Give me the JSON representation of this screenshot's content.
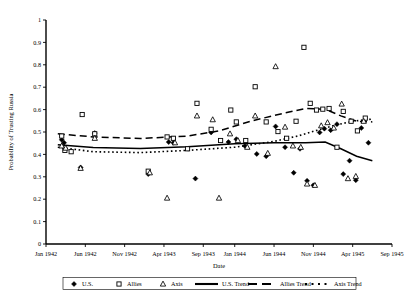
{
  "chart_data": {
    "type": "scatter",
    "title": "",
    "xlabel": "Date",
    "ylabel": "Probability of Trusting Russia",
    "ylim": [
      0,
      1
    ],
    "ytick_labels": [
      "0",
      "0.1",
      "0.2",
      "0.3",
      "0.4",
      "0.5",
      "0.6",
      "0.7",
      "0.8",
      "0.9",
      "1"
    ],
    "ytick_values": [
      0,
      0.1,
      0.2,
      0.3,
      0.4,
      0.5,
      0.6,
      0.7,
      0.8,
      0.9,
      1
    ],
    "xtick_labels": [
      "Jan 1942",
      "Jun 1942",
      "Nov 1942",
      "Apr 1943",
      "Sep 1943",
      "Jan 1944",
      "Jun 1944",
      "Nov 1944",
      "Apr 1945",
      "Sep 1945"
    ],
    "xtick_values": [
      0,
      5,
      10,
      15,
      20,
      24,
      29,
      34,
      39,
      44
    ],
    "xlim": [
      0,
      44
    ],
    "grid": false,
    "legend_position": "bottom",
    "series": [
      {
        "name": "U.S.",
        "marker": "filled-diamond",
        "points": [
          {
            "x": 2.0,
            "y": 0.465
          },
          {
            "x": 2.3,
            "y": 0.452
          },
          {
            "x": 4.4,
            "y": 0.342
          },
          {
            "x": 6.2,
            "y": 0.495
          },
          {
            "x": 13.0,
            "y": 0.312
          },
          {
            "x": 15.6,
            "y": 0.455
          },
          {
            "x": 16.2,
            "y": 0.452
          },
          {
            "x": 19.0,
            "y": 0.292
          },
          {
            "x": 21.0,
            "y": 0.498
          },
          {
            "x": 23.2,
            "y": 0.455
          },
          {
            "x": 24.2,
            "y": 0.468
          },
          {
            "x": 25.3,
            "y": 0.438
          },
          {
            "x": 26.8,
            "y": 0.402
          },
          {
            "x": 28.0,
            "y": 0.392
          },
          {
            "x": 29.2,
            "y": 0.525
          },
          {
            "x": 30.4,
            "y": 0.432
          },
          {
            "x": 31.5,
            "y": 0.318
          },
          {
            "x": 32.3,
            "y": 0.425
          },
          {
            "x": 33.2,
            "y": 0.282
          },
          {
            "x": 34.0,
            "y": 0.262
          },
          {
            "x": 34.8,
            "y": 0.498
          },
          {
            "x": 35.4,
            "y": 0.515
          },
          {
            "x": 36.2,
            "y": 0.508
          },
          {
            "x": 37.0,
            "y": 0.535
          },
          {
            "x": 37.8,
            "y": 0.312
          },
          {
            "x": 38.6,
            "y": 0.372
          },
          {
            "x": 39.4,
            "y": 0.285
          },
          {
            "x": 40.1,
            "y": 0.518
          },
          {
            "x": 41.0,
            "y": 0.452
          }
        ]
      },
      {
        "name": "Allies",
        "marker": "open-square",
        "points": [
          {
            "x": 2.0,
            "y": 0.482
          },
          {
            "x": 2.4,
            "y": 0.418
          },
          {
            "x": 3.2,
            "y": 0.412
          },
          {
            "x": 4.6,
            "y": 0.578
          },
          {
            "x": 6.2,
            "y": 0.492
          },
          {
            "x": 13.0,
            "y": 0.325
          },
          {
            "x": 15.4,
            "y": 0.478
          },
          {
            "x": 16.2,
            "y": 0.472
          },
          {
            "x": 18.0,
            "y": 0.425
          },
          {
            "x": 19.2,
            "y": 0.628
          },
          {
            "x": 21.0,
            "y": 0.512
          },
          {
            "x": 22.2,
            "y": 0.462
          },
          {
            "x": 23.5,
            "y": 0.598
          },
          {
            "x": 24.2,
            "y": 0.545
          },
          {
            "x": 25.4,
            "y": 0.462
          },
          {
            "x": 26.6,
            "y": 0.702
          },
          {
            "x": 28.0,
            "y": 0.545
          },
          {
            "x": 29.5,
            "y": 0.502
          },
          {
            "x": 30.6,
            "y": 0.472
          },
          {
            "x": 31.8,
            "y": 0.548
          },
          {
            "x": 32.8,
            "y": 0.878
          },
          {
            "x": 33.6,
            "y": 0.628
          },
          {
            "x": 34.4,
            "y": 0.598
          },
          {
            "x": 35.2,
            "y": 0.602
          },
          {
            "x": 36.0,
            "y": 0.605
          },
          {
            "x": 37.0,
            "y": 0.432
          },
          {
            "x": 37.8,
            "y": 0.592
          },
          {
            "x": 38.8,
            "y": 0.548
          },
          {
            "x": 39.6,
            "y": 0.505
          },
          {
            "x": 40.6,
            "y": 0.562
          }
        ]
      },
      {
        "name": "Axis",
        "marker": "open-triangle",
        "points": [
          {
            "x": 2.0,
            "y": 0.438
          },
          {
            "x": 2.5,
            "y": 0.428
          },
          {
            "x": 4.4,
            "y": 0.338
          },
          {
            "x": 6.2,
            "y": 0.472
          },
          {
            "x": 13.2,
            "y": 0.318
          },
          {
            "x": 15.4,
            "y": 0.205
          },
          {
            "x": 16.4,
            "y": 0.452
          },
          {
            "x": 19.2,
            "y": 0.572
          },
          {
            "x": 21.2,
            "y": 0.555
          },
          {
            "x": 22.0,
            "y": 0.205
          },
          {
            "x": 23.4,
            "y": 0.492
          },
          {
            "x": 24.4,
            "y": 0.462
          },
          {
            "x": 25.6,
            "y": 0.432
          },
          {
            "x": 26.6,
            "y": 0.572
          },
          {
            "x": 28.2,
            "y": 0.405
          },
          {
            "x": 29.2,
            "y": 0.792
          },
          {
            "x": 30.4,
            "y": 0.522
          },
          {
            "x": 31.4,
            "y": 0.438
          },
          {
            "x": 32.4,
            "y": 0.432
          },
          {
            "x": 33.2,
            "y": 0.268
          },
          {
            "x": 34.2,
            "y": 0.262
          },
          {
            "x": 35.0,
            "y": 0.528
          },
          {
            "x": 35.8,
            "y": 0.542
          },
          {
            "x": 36.6,
            "y": 0.518
          },
          {
            "x": 37.6,
            "y": 0.625
          },
          {
            "x": 38.4,
            "y": 0.292
          },
          {
            "x": 39.4,
            "y": 0.302
          },
          {
            "x": 40.4,
            "y": 0.548
          }
        ]
      }
    ],
    "trendlines": [
      {
        "name": "U.S. Trend",
        "style": "solid",
        "points": [
          {
            "x": 1.5,
            "y": 0.443
          },
          {
            "x": 6.0,
            "y": 0.431
          },
          {
            "x": 12.0,
            "y": 0.426
          },
          {
            "x": 18.0,
            "y": 0.434
          },
          {
            "x": 24.0,
            "y": 0.448
          },
          {
            "x": 29.0,
            "y": 0.452
          },
          {
            "x": 33.0,
            "y": 0.452
          },
          {
            "x": 35.5,
            "y": 0.455
          },
          {
            "x": 37.5,
            "y": 0.425
          },
          {
            "x": 39.5,
            "y": 0.392
          },
          {
            "x": 41.5,
            "y": 0.372
          }
        ]
      },
      {
        "name": "Allies Trend",
        "style": "dashed",
        "points": [
          {
            "x": 1.5,
            "y": 0.492
          },
          {
            "x": 6.0,
            "y": 0.478
          },
          {
            "x": 12.0,
            "y": 0.471
          },
          {
            "x": 18.0,
            "y": 0.482
          },
          {
            "x": 22.0,
            "y": 0.505
          },
          {
            "x": 26.0,
            "y": 0.548
          },
          {
            "x": 30.0,
            "y": 0.582
          },
          {
            "x": 33.0,
            "y": 0.605
          },
          {
            "x": 35.5,
            "y": 0.602
          },
          {
            "x": 37.5,
            "y": 0.572
          },
          {
            "x": 39.5,
            "y": 0.548
          },
          {
            "x": 41.5,
            "y": 0.545
          }
        ]
      },
      {
        "name": "Axis Trend",
        "style": "dotted",
        "points": [
          {
            "x": 1.5,
            "y": 0.432
          },
          {
            "x": 6.0,
            "y": 0.412
          },
          {
            "x": 12.0,
            "y": 0.408
          },
          {
            "x": 18.0,
            "y": 0.418
          },
          {
            "x": 24.0,
            "y": 0.432
          },
          {
            "x": 29.0,
            "y": 0.458
          },
          {
            "x": 32.0,
            "y": 0.482
          },
          {
            "x": 34.5,
            "y": 0.508
          },
          {
            "x": 36.5,
            "y": 0.528
          },
          {
            "x": 39.0,
            "y": 0.548
          },
          {
            "x": 41.5,
            "y": 0.558
          }
        ]
      }
    ],
    "legend": [
      {
        "label": "U.S.",
        "marker": "filled-diamond"
      },
      {
        "label": "Allies",
        "marker": "open-square"
      },
      {
        "label": "Axis",
        "marker": "open-triangle"
      },
      {
        "label": "U.S. Trend",
        "marker": "solid-line"
      },
      {
        "label": "Allies Trend",
        "marker": "dashed-line"
      },
      {
        "label": "Axis Trend",
        "marker": "dotted-line"
      }
    ]
  }
}
